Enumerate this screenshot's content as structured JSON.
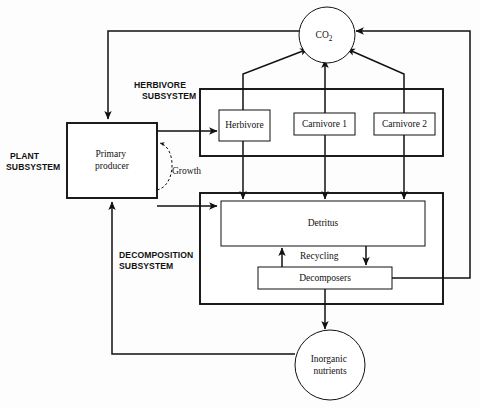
{
  "diagram": {
    "style": {
      "stroke": "#111111",
      "fill": "#ffffff",
      "background": "#fdfdfd"
    },
    "subsystems": [
      {
        "id": "plant",
        "label_line1": "PLANT",
        "label_line2": "SUBSYSTEM"
      },
      {
        "id": "herbivore",
        "label_line1": "HERBIVORE",
        "label_line2": "SUBSYSTEM"
      },
      {
        "id": "decomposition",
        "label_line1": "DECOMPOSITION",
        "label_line2": "SUBSYSTEM"
      }
    ],
    "nodes": [
      {
        "id": "co2",
        "shape": "circle",
        "label": "CO",
        "subscript": "2"
      },
      {
        "id": "primary-producer",
        "shape": "box",
        "label_line1": "Primary",
        "label_line2": "producer"
      },
      {
        "id": "herbivore",
        "shape": "box",
        "label": "Herbivore"
      },
      {
        "id": "carnivore1",
        "shape": "box",
        "label": "Carnivore 1"
      },
      {
        "id": "carnivore2",
        "shape": "box",
        "label": "Carnivore 2"
      },
      {
        "id": "detritus",
        "shape": "box",
        "label": "Detritus"
      },
      {
        "id": "decomposers",
        "shape": "box",
        "label": "Decomposers"
      },
      {
        "id": "inorganic-nutrients",
        "shape": "circle",
        "label_line1": "Inorganic",
        "label_line2": "nutrients"
      }
    ],
    "edge_labels": [
      {
        "id": "growth",
        "label": "Growth"
      },
      {
        "id": "recycling",
        "label": "Recycling"
      }
    ]
  }
}
